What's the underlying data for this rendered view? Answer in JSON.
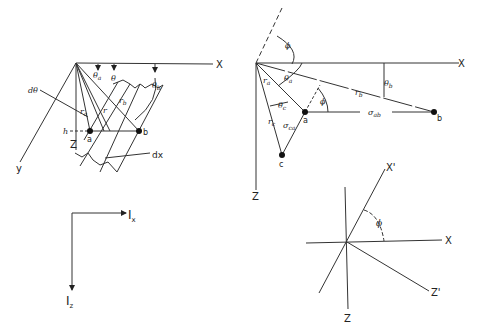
{
  "figure": {
    "panel1": {
      "axis_x": "X",
      "axis_y": "y",
      "axis_z": "Z",
      "angle_a": "θ",
      "angle_a_sub": "a",
      "angle": "θ",
      "angle_b": "θ",
      "angle_b_sub": "b",
      "d_theta": "dθ",
      "r_a": "r",
      "r_a_sub": "a",
      "r": "r",
      "r_b": "r",
      "r_b_sub": "b",
      "h": "h",
      "point_a": "a",
      "point_b": "b",
      "dx": "dx"
    },
    "panel2": {
      "axis_x": "X",
      "axis_z": "Z",
      "phi_top": "ϕ",
      "phi_a": "ϕ",
      "r_a": "r",
      "r_a_sub": "a",
      "r_b": "r",
      "r_b_sub": "b",
      "r_c": "r",
      "r_c_sub": "c",
      "theta_a": "θ",
      "theta_a_sub": "a",
      "theta_b": "θ",
      "theta_b_sub": "b",
      "theta_c": "θ",
      "theta_c_sub": "c",
      "sigma_ab": "σ",
      "sigma_ab_sub": "ab",
      "sigma_ca": "σ",
      "sigma_ca_sub": "ca",
      "point_a": "a",
      "point_b": "b",
      "point_c": "c"
    },
    "panel3": {
      "ix": "I",
      "ix_sub": "x",
      "iz": "I",
      "iz_sub": "z"
    },
    "panel4": {
      "axis_x": "X",
      "axis_z": "Z",
      "axis_xp": "X'",
      "axis_zp": "Z'",
      "phi": "ϕ"
    }
  }
}
